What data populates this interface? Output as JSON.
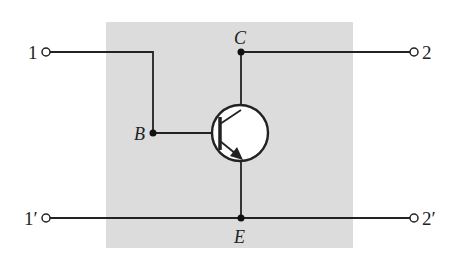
{
  "diagram": {
    "type": "circuit",
    "title": "",
    "background_box_color": "#dcdcdc",
    "wire_color": "#222222",
    "terminals": {
      "in_top": "1",
      "in_bottom": "1′",
      "out_top": "2",
      "out_bottom": "2′"
    },
    "nodes": {
      "base": "B",
      "collector": "C",
      "emitter": "E"
    },
    "component": "npn-transistor"
  }
}
